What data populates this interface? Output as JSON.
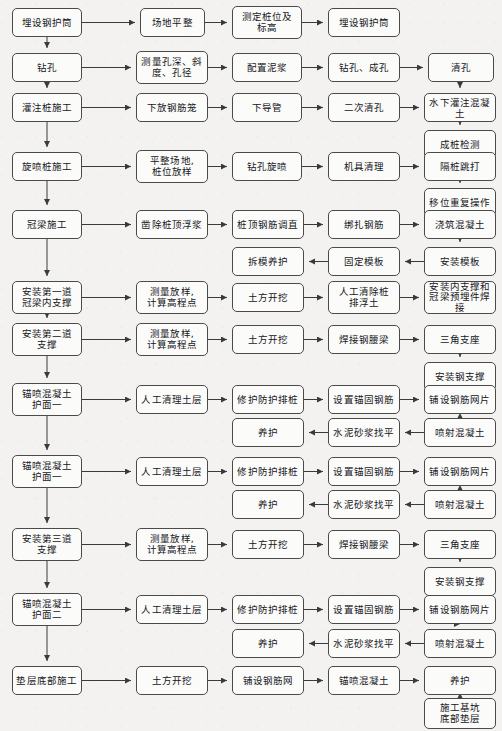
{
  "diagram": {
    "style": {
      "box_fill": "#fbfbfa",
      "box_border": "#4a4a4a",
      "arrow_color": "#3a3a3a",
      "background": "#f3f2f0",
      "text_color": "#16161a"
    },
    "nodes": [
      {
        "id": "n1",
        "label": "埋设钢护筒",
        "x": 12,
        "y": 8,
        "w": 70,
        "h": 29
      },
      {
        "id": "n2",
        "label": "场地平整",
        "x": 140,
        "y": 8,
        "w": 65,
        "h": 29
      },
      {
        "id": "n3",
        "label": "测定桩位及\n标高",
        "x": 232,
        "y": 6,
        "w": 70,
        "h": 33
      },
      {
        "id": "n4",
        "label": "埋设钢护筒",
        "x": 328,
        "y": 8,
        "w": 72,
        "h": 29
      },
      {
        "id": "n5",
        "label": "钻孔",
        "x": 12,
        "y": 53,
        "w": 70,
        "h": 29
      },
      {
        "id": "n6",
        "label": "测量孔深、斜\n度、孔径",
        "x": 136,
        "y": 51,
        "w": 72,
        "h": 33
      },
      {
        "id": "n7",
        "label": "配置泥浆",
        "x": 232,
        "y": 53,
        "w": 70,
        "h": 29
      },
      {
        "id": "n8",
        "label": "钻孔、成孔",
        "x": 328,
        "y": 53,
        "w": 72,
        "h": 29
      },
      {
        "id": "n9",
        "label": "清孔",
        "x": 428,
        "y": 53,
        "w": 66,
        "h": 29
      },
      {
        "id": "n10",
        "label": "灌注桩施工",
        "x": 12,
        "y": 93,
        "w": 70,
        "h": 29
      },
      {
        "id": "n11",
        "label": "下放钢筋笼",
        "x": 136,
        "y": 93,
        "w": 72,
        "h": 29
      },
      {
        "id": "n12",
        "label": "下导管",
        "x": 232,
        "y": 93,
        "w": 70,
        "h": 29
      },
      {
        "id": "n13",
        "label": "二次清孔",
        "x": 328,
        "y": 93,
        "w": 72,
        "h": 29
      },
      {
        "id": "n14",
        "label": "水下灌注混凝土",
        "x": 424,
        "y": 93,
        "w": 72,
        "h": 29
      },
      {
        "id": "n15",
        "label": "成桩检测",
        "x": 424,
        "y": 130,
        "w": 72,
        "h": 29
      },
      {
        "id": "n16",
        "label": "旋喷桩施工",
        "x": 12,
        "y": 152,
        "w": 70,
        "h": 29
      },
      {
        "id": "n17",
        "label": "平整场地,\n桩位放样",
        "x": 136,
        "y": 150,
        "w": 72,
        "h": 33
      },
      {
        "id": "n18",
        "label": "钻孔旋喷",
        "x": 232,
        "y": 152,
        "w": 70,
        "h": 29
      },
      {
        "id": "n19",
        "label": "机具清理",
        "x": 328,
        "y": 152,
        "w": 72,
        "h": 29
      },
      {
        "id": "n20",
        "label": "隔桩跳打",
        "x": 424,
        "y": 152,
        "w": 72,
        "h": 29
      },
      {
        "id": "n21",
        "label": "移位重复操作",
        "x": 424,
        "y": 188,
        "w": 72,
        "h": 29
      },
      {
        "id": "n22",
        "label": "冠梁施工",
        "x": 12,
        "y": 210,
        "w": 70,
        "h": 29
      },
      {
        "id": "n23",
        "label": "凿除桩顶浮浆",
        "x": 136,
        "y": 210,
        "w": 72,
        "h": 29
      },
      {
        "id": "n24",
        "label": "桩顶钢筋调直",
        "x": 232,
        "y": 210,
        "w": 72,
        "h": 29
      },
      {
        "id": "n25",
        "label": "绑扎钢筋",
        "x": 328,
        "y": 210,
        "w": 72,
        "h": 29
      },
      {
        "id": "n26",
        "label": "浇筑混凝土",
        "x": 424,
        "y": 210,
        "w": 72,
        "h": 29
      },
      {
        "id": "n27",
        "label": "拆模养护",
        "x": 232,
        "y": 247,
        "w": 72,
        "h": 29
      },
      {
        "id": "n28",
        "label": "固定模板",
        "x": 328,
        "y": 247,
        "w": 72,
        "h": 29
      },
      {
        "id": "n29",
        "label": "安装模板",
        "x": 424,
        "y": 247,
        "w": 72,
        "h": 29
      },
      {
        "id": "n30",
        "label": "安装第一道\n冠梁内支撑",
        "x": 12,
        "y": 281,
        "w": 70,
        "h": 33
      },
      {
        "id": "n31",
        "label": "测量放样,\n计算高程点",
        "x": 136,
        "y": 281,
        "w": 72,
        "h": 33
      },
      {
        "id": "n32",
        "label": "土方开挖",
        "x": 232,
        "y": 283,
        "w": 72,
        "h": 29
      },
      {
        "id": "n33",
        "label": "人工清除桩\n排浮土",
        "x": 328,
        "y": 281,
        "w": 72,
        "h": 33
      },
      {
        "id": "n34",
        "label": "安装内支撑和\n冠梁预埋件焊接",
        "x": 424,
        "y": 281,
        "w": 72,
        "h": 33
      },
      {
        "id": "n35",
        "label": "安装第二道\n支撑",
        "x": 12,
        "y": 323,
        "w": 70,
        "h": 33
      },
      {
        "id": "n36",
        "label": "测量放样,\n计算高程点",
        "x": 136,
        "y": 323,
        "w": 72,
        "h": 33
      },
      {
        "id": "n37",
        "label": "土方开挖",
        "x": 232,
        "y": 325,
        "w": 72,
        "h": 29
      },
      {
        "id": "n38",
        "label": "焊接钢腰梁",
        "x": 328,
        "y": 325,
        "w": 72,
        "h": 29
      },
      {
        "id": "n39",
        "label": "三角支座",
        "x": 424,
        "y": 325,
        "w": 72,
        "h": 29
      },
      {
        "id": "n40",
        "label": "安装钢支撑",
        "x": 424,
        "y": 362,
        "w": 72,
        "h": 29
      },
      {
        "id": "n41",
        "label": "锚喷混凝土\n护面一",
        "x": 12,
        "y": 383,
        "w": 70,
        "h": 33
      },
      {
        "id": "n42",
        "label": "人工清理土层",
        "x": 136,
        "y": 385,
        "w": 72,
        "h": 29
      },
      {
        "id": "n43",
        "label": "修护防护排桩",
        "x": 232,
        "y": 385,
        "w": 72,
        "h": 29
      },
      {
        "id": "n44",
        "label": "设置锚固钢筋",
        "x": 328,
        "y": 385,
        "w": 72,
        "h": 29
      },
      {
        "id": "n45",
        "label": "铺设钢筋网片",
        "x": 424,
        "y": 385,
        "w": 72,
        "h": 29
      },
      {
        "id": "n46",
        "label": "养护",
        "x": 232,
        "y": 418,
        "w": 72,
        "h": 29
      },
      {
        "id": "n47",
        "label": "水泥砂浆找平",
        "x": 328,
        "y": 418,
        "w": 72,
        "h": 29
      },
      {
        "id": "n48",
        "label": "喷射混凝土",
        "x": 424,
        "y": 418,
        "w": 72,
        "h": 29
      },
      {
        "id": "n49",
        "label": "锚喷混凝土\n护面一",
        "x": 12,
        "y": 455,
        "w": 70,
        "h": 33
      },
      {
        "id": "n50",
        "label": "人工清理土层",
        "x": 136,
        "y": 457,
        "w": 72,
        "h": 29
      },
      {
        "id": "n51",
        "label": "修护防护排桩",
        "x": 232,
        "y": 457,
        "w": 72,
        "h": 29
      },
      {
        "id": "n52",
        "label": "设置锚固钢筋",
        "x": 328,
        "y": 457,
        "w": 72,
        "h": 29
      },
      {
        "id": "n53",
        "label": "铺设钢筋网片",
        "x": 424,
        "y": 457,
        "w": 72,
        "h": 29
      },
      {
        "id": "n54",
        "label": "养护",
        "x": 232,
        "y": 490,
        "w": 72,
        "h": 29
      },
      {
        "id": "n55",
        "label": "水泥砂浆找平",
        "x": 328,
        "y": 490,
        "w": 72,
        "h": 29
      },
      {
        "id": "n56",
        "label": "喷射混凝土",
        "x": 424,
        "y": 490,
        "w": 72,
        "h": 29
      },
      {
        "id": "n57",
        "label": "安装第三道\n支撑",
        "x": 12,
        "y": 528,
        "w": 70,
        "h": 33
      },
      {
        "id": "n58",
        "label": "测量放样,\n计算高程点",
        "x": 136,
        "y": 528,
        "w": 72,
        "h": 33
      },
      {
        "id": "n59",
        "label": "土方开挖",
        "x": 232,
        "y": 530,
        "w": 72,
        "h": 29
      },
      {
        "id": "n60",
        "label": "焊接钢腰梁",
        "x": 328,
        "y": 530,
        "w": 72,
        "h": 29
      },
      {
        "id": "n61",
        "label": "三角支座",
        "x": 424,
        "y": 530,
        "w": 72,
        "h": 29
      },
      {
        "id": "n62",
        "label": "安装钢支撑",
        "x": 424,
        "y": 567,
        "w": 72,
        "h": 29
      },
      {
        "id": "n63",
        "label": "锚喷混凝土\n护面二",
        "x": 12,
        "y": 593,
        "w": 70,
        "h": 33
      },
      {
        "id": "n64",
        "label": "人工清理土层",
        "x": 136,
        "y": 595,
        "w": 72,
        "h": 29
      },
      {
        "id": "n65",
        "label": "修护防护排桩",
        "x": 232,
        "y": 595,
        "w": 72,
        "h": 29
      },
      {
        "id": "n66",
        "label": "设置锚固钢筋",
        "x": 328,
        "y": 595,
        "w": 72,
        "h": 29
      },
      {
        "id": "n67",
        "label": "铺设钢筋网片",
        "x": 424,
        "y": 595,
        "w": 72,
        "h": 29
      },
      {
        "id": "n68",
        "label": "养护",
        "x": 232,
        "y": 629,
        "w": 72,
        "h": 29
      },
      {
        "id": "n69",
        "label": "水泥砂浆找平",
        "x": 328,
        "y": 629,
        "w": 72,
        "h": 29
      },
      {
        "id": "n70",
        "label": "喷射混凝土",
        "x": 424,
        "y": 629,
        "w": 72,
        "h": 29
      },
      {
        "id": "n71",
        "label": "垫层底部施工",
        "x": 12,
        "y": 666,
        "w": 70,
        "h": 29
      },
      {
        "id": "n72",
        "label": "土方开挖",
        "x": 136,
        "y": 666,
        "w": 72,
        "h": 29
      },
      {
        "id": "n73",
        "label": "铺设钢筋网",
        "x": 232,
        "y": 666,
        "w": 72,
        "h": 29
      },
      {
        "id": "n74",
        "label": "锚喷混凝土",
        "x": 328,
        "y": 666,
        "w": 72,
        "h": 29
      },
      {
        "id": "n75",
        "label": "养护",
        "x": 424,
        "y": 666,
        "w": 72,
        "h": 29
      },
      {
        "id": "n76",
        "label": "施工基坑\n底部垫层",
        "x": 424,
        "y": 698,
        "w": 72,
        "h": 31
      }
    ],
    "edges": [
      {
        "from": "n1",
        "to": "n2",
        "dir": "right"
      },
      {
        "from": "n2",
        "to": "n3",
        "dir": "right"
      },
      {
        "from": "n3",
        "to": "n4",
        "dir": "right"
      },
      {
        "from": "n1",
        "to": "n5",
        "dir": "down"
      },
      {
        "from": "n5",
        "to": "n6",
        "dir": "right"
      },
      {
        "from": "n6",
        "to": "n7",
        "dir": "right"
      },
      {
        "from": "n7",
        "to": "n8",
        "dir": "right"
      },
      {
        "from": "n8",
        "to": "n9",
        "dir": "right"
      },
      {
        "from": "n5",
        "to": "n10",
        "dir": "down"
      },
      {
        "from": "n9",
        "to": "n14",
        "dir": "down"
      },
      {
        "from": "n10",
        "to": "n11",
        "dir": "right"
      },
      {
        "from": "n11",
        "to": "n12",
        "dir": "right"
      },
      {
        "from": "n12",
        "to": "n13",
        "dir": "right"
      },
      {
        "from": "n13",
        "to": "n14",
        "dir": "right"
      },
      {
        "from": "n14",
        "to": "n15",
        "dir": "down"
      },
      {
        "from": "n10",
        "to": "n16",
        "dir": "down"
      },
      {
        "from": "n16",
        "to": "n17",
        "dir": "right"
      },
      {
        "from": "n17",
        "to": "n18",
        "dir": "right"
      },
      {
        "from": "n18",
        "to": "n19",
        "dir": "right"
      },
      {
        "from": "n19",
        "to": "n20",
        "dir": "right"
      },
      {
        "from": "n20",
        "to": "n21",
        "dir": "down"
      },
      {
        "from": "n16",
        "to": "n22",
        "dir": "down"
      },
      {
        "from": "n22",
        "to": "n23",
        "dir": "right"
      },
      {
        "from": "n23",
        "to": "n24",
        "dir": "right"
      },
      {
        "from": "n24",
        "to": "n25",
        "dir": "right"
      },
      {
        "from": "n25",
        "to": "n26",
        "dir": "right"
      },
      {
        "from": "n26",
        "to": "n29",
        "dir": "down"
      },
      {
        "from": "n29",
        "to": "n28",
        "dir": "left"
      },
      {
        "from": "n28",
        "to": "n27",
        "dir": "left"
      },
      {
        "from": "n22",
        "to": "n30",
        "dir": "down"
      },
      {
        "from": "n30",
        "to": "n31",
        "dir": "right"
      },
      {
        "from": "n31",
        "to": "n32",
        "dir": "right"
      },
      {
        "from": "n32",
        "to": "n33",
        "dir": "right"
      },
      {
        "from": "n33",
        "to": "n34",
        "dir": "right"
      },
      {
        "from": "n30",
        "to": "n35",
        "dir": "down"
      },
      {
        "from": "n35",
        "to": "n36",
        "dir": "right"
      },
      {
        "from": "n36",
        "to": "n37",
        "dir": "right"
      },
      {
        "from": "n37",
        "to": "n38",
        "dir": "right"
      },
      {
        "from": "n38",
        "to": "n39",
        "dir": "right"
      },
      {
        "from": "n39",
        "to": "n40",
        "dir": "down"
      },
      {
        "from": "n35",
        "to": "n41",
        "dir": "down"
      },
      {
        "from": "n41",
        "to": "n42",
        "dir": "right"
      },
      {
        "from": "n42",
        "to": "n43",
        "dir": "right"
      },
      {
        "from": "n43",
        "to": "n44",
        "dir": "right"
      },
      {
        "from": "n44",
        "to": "n45",
        "dir": "right"
      },
      {
        "from": "n45",
        "to": "n48",
        "dir": "down"
      },
      {
        "from": "n48",
        "to": "n47",
        "dir": "left"
      },
      {
        "from": "n47",
        "to": "n46",
        "dir": "left"
      },
      {
        "from": "n41",
        "to": "n49",
        "dir": "down"
      },
      {
        "from": "n49",
        "to": "n50",
        "dir": "right"
      },
      {
        "from": "n50",
        "to": "n51",
        "dir": "right"
      },
      {
        "from": "n51",
        "to": "n52",
        "dir": "right"
      },
      {
        "from": "n52",
        "to": "n53",
        "dir": "right"
      },
      {
        "from": "n53",
        "to": "n56",
        "dir": "down"
      },
      {
        "from": "n56",
        "to": "n55",
        "dir": "left"
      },
      {
        "from": "n55",
        "to": "n54",
        "dir": "left"
      },
      {
        "from": "n49",
        "to": "n57",
        "dir": "down"
      },
      {
        "from": "n57",
        "to": "n58",
        "dir": "right"
      },
      {
        "from": "n58",
        "to": "n59",
        "dir": "right"
      },
      {
        "from": "n59",
        "to": "n60",
        "dir": "right"
      },
      {
        "from": "n60",
        "to": "n61",
        "dir": "right"
      },
      {
        "from": "n61",
        "to": "n62",
        "dir": "down"
      },
      {
        "from": "n57",
        "to": "n63",
        "dir": "down"
      },
      {
        "from": "n63",
        "to": "n64",
        "dir": "right"
      },
      {
        "from": "n64",
        "to": "n65",
        "dir": "right"
      },
      {
        "from": "n65",
        "to": "n66",
        "dir": "right"
      },
      {
        "from": "n66",
        "to": "n67",
        "dir": "right"
      },
      {
        "from": "n67",
        "to": "n70",
        "dir": "down"
      },
      {
        "from": "n70",
        "to": "n69",
        "dir": "left"
      },
      {
        "from": "n69",
        "to": "n68",
        "dir": "left"
      },
      {
        "from": "n63",
        "to": "n71",
        "dir": "down"
      },
      {
        "from": "n71",
        "to": "n72",
        "dir": "right"
      },
      {
        "from": "n72",
        "to": "n73",
        "dir": "right"
      },
      {
        "from": "n73",
        "to": "n74",
        "dir": "right"
      },
      {
        "from": "n74",
        "to": "n75",
        "dir": "right"
      },
      {
        "from": "n75",
        "to": "n76",
        "dir": "down"
      }
    ]
  }
}
